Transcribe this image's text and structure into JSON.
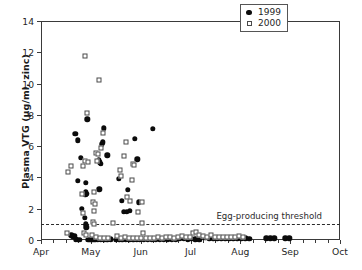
{
  "chart_data": {
    "type": "scatter",
    "title": "",
    "xlabel": "",
    "ylabel": "Plasma VTG (µg/ml, zinc)",
    "xtick_labels": [
      "Apr",
      "May",
      "Jun",
      "Jul",
      "Aug",
      "Sep",
      "Oct"
    ],
    "xtick_positions": [
      0,
      1,
      2,
      3,
      4,
      5,
      6
    ],
    "xlim": [
      0,
      6
    ],
    "ytick_labels": [
      "0",
      "2",
      "4",
      "6",
      "8",
      "10",
      "12",
      "14"
    ],
    "ytick_values": [
      0,
      2,
      4,
      6,
      8,
      10,
      12,
      14
    ],
    "ylim": [
      0,
      14
    ],
    "grid": false,
    "minor_xticks_per_month": 4,
    "legend": {
      "position": "top-right",
      "entries": [
        {
          "label": "1999",
          "marker": "filled-circle",
          "color": "#0b0b0b"
        },
        {
          "label": "2000",
          "marker": "open-square",
          "color": "#4a4a4a"
        }
      ]
    },
    "annotations": [
      {
        "text": "Egg-producing threshold",
        "y": 1.0,
        "x": 3.52,
        "type": "threshold-line-label",
        "line_style": "dashed"
      }
    ],
    "threshold": {
      "value": 1.0,
      "style": "dashed",
      "color": "#2b2b2b"
    },
    "series": [
      {
        "name": "1999",
        "marker": "filled-circle",
        "color": "#0b0b0b",
        "points": [
          [
            0.61,
            0.3
          ],
          [
            0.64,
            0.22
          ],
          [
            0.67,
            0.27
          ],
          [
            0.7,
            0.05
          ],
          [
            0.74,
            0.02
          ],
          [
            0.78,
            0.02
          ],
          [
            0.69,
            6.78
          ],
          [
            0.74,
            6.38
          ],
          [
            0.8,
            5.25
          ],
          [
            0.74,
            3.78
          ],
          [
            0.82,
            2.0
          ],
          [
            0.93,
            7.72
          ],
          [
            0.9,
            3.66
          ],
          [
            0.9,
            3.08
          ],
          [
            0.92,
            2.95
          ],
          [
            0.89,
            2.88
          ],
          [
            0.88,
            1.42
          ],
          [
            0.9,
            1.0
          ],
          [
            0.91,
            0.8
          ],
          [
            0.95,
            0.02
          ],
          [
            0.99,
            0.02
          ],
          [
            1.03,
            0.02
          ],
          [
            1.07,
            0.05
          ],
          [
            1.1,
            0.02
          ],
          [
            1.17,
            3.24
          ],
          [
            1.16,
            5.1
          ],
          [
            1.18,
            4.96
          ],
          [
            1.2,
            4.88
          ],
          [
            1.22,
            6.12
          ],
          [
            1.24,
            6.25
          ],
          [
            1.26,
            7.15
          ],
          [
            1.33,
            5.42
          ],
          [
            1.14,
            0.02
          ],
          [
            1.2,
            0.02
          ],
          [
            1.27,
            0.02
          ],
          [
            1.33,
            0.02
          ],
          [
            1.4,
            0.05
          ],
          [
            1.56,
            3.9
          ],
          [
            1.62,
            2.52
          ],
          [
            1.66,
            1.8
          ],
          [
            1.72,
            1.8
          ],
          [
            1.78,
            1.85
          ],
          [
            1.74,
            3.22
          ],
          [
            1.5,
            0.02
          ],
          [
            1.57,
            0.05
          ],
          [
            1.63,
            0.02
          ],
          [
            1.7,
            0.02
          ],
          [
            1.77,
            0.02
          ],
          [
            1.88,
            6.45
          ],
          [
            1.93,
            5.15
          ],
          [
            1.96,
            2.42
          ],
          [
            1.85,
            0.02
          ],
          [
            1.92,
            0.05
          ],
          [
            1.98,
            0.02
          ],
          [
            2.24,
            7.12
          ],
          [
            2.06,
            0.02
          ],
          [
            2.14,
            0.05
          ],
          [
            2.22,
            0.02
          ],
          [
            2.3,
            0.02
          ],
          [
            2.38,
            0.05
          ],
          [
            2.46,
            0.02
          ],
          [
            2.54,
            0.02
          ],
          [
            2.62,
            0.05
          ],
          [
            2.7,
            0.02
          ],
          [
            2.78,
            0.1
          ],
          [
            2.86,
            0.08
          ],
          [
            2.94,
            0.05
          ],
          [
            3.02,
            0.08
          ],
          [
            3.1,
            0.05
          ],
          [
            3.18,
            0.02
          ],
          [
            3.3,
            0.14
          ],
          [
            3.38,
            0.1
          ],
          [
            3.46,
            0.12
          ],
          [
            3.54,
            0.12
          ],
          [
            3.62,
            0.1
          ],
          [
            3.7,
            0.1
          ],
          [
            3.78,
            0.08
          ],
          [
            3.86,
            0.1
          ],
          [
            3.94,
            0.12
          ],
          [
            4.02,
            0.1
          ],
          [
            4.1,
            0.1
          ],
          [
            4.18,
            0.08
          ],
          [
            4.52,
            0.1
          ],
          [
            4.6,
            0.1
          ],
          [
            4.68,
            0.12
          ],
          [
            4.9,
            0.1
          ],
          [
            4.98,
            0.1
          ]
        ]
      },
      {
        "name": "2000",
        "marker": "open-square",
        "color": "#4a4a4a",
        "points": [
          [
            0.55,
            4.34
          ],
          [
            0.61,
            4.72
          ],
          [
            0.52,
            0.42
          ],
          [
            0.88,
            11.75
          ],
          [
            0.93,
            8.15
          ],
          [
            0.85,
            4.7
          ],
          [
            0.88,
            5.02
          ],
          [
            0.95,
            5.0
          ],
          [
            0.83,
            2.92
          ],
          [
            0.85,
            1.72
          ],
          [
            0.87,
            0.42
          ],
          [
            0.91,
            0.3
          ],
          [
            1.16,
            10.25
          ],
          [
            1.1,
            5.58
          ],
          [
            1.13,
            5.05
          ],
          [
            1.14,
            5.48
          ],
          [
            1.2,
            5.88
          ],
          [
            1.24,
            6.85
          ],
          [
            1.07,
            3.04
          ],
          [
            1.05,
            2.46
          ],
          [
            1.09,
            2.32
          ],
          [
            1.07,
            1.85
          ],
          [
            1.04,
            1.12
          ],
          [
            1.06,
            1.02
          ],
          [
            1.02,
            0.32
          ],
          [
            1.1,
            0.18
          ],
          [
            1.18,
            0.1
          ],
          [
            1.26,
            0.12
          ],
          [
            1.34,
            0.1
          ],
          [
            1.45,
            1.1
          ],
          [
            1.58,
            4.46
          ],
          [
            1.6,
            4.08
          ],
          [
            1.66,
            5.36
          ],
          [
            1.7,
            6.28
          ],
          [
            1.72,
            2.72
          ],
          [
            1.78,
            2.5
          ],
          [
            1.82,
            3.82
          ],
          [
            1.84,
            4.88
          ],
          [
            1.86,
            4.78
          ],
          [
            1.52,
            0.28
          ],
          [
            1.6,
            0.12
          ],
          [
            1.68,
            0.22
          ],
          [
            1.76,
            0.12
          ],
          [
            1.84,
            0.1
          ],
          [
            1.94,
            1.78
          ],
          [
            2.02,
            2.42
          ],
          [
            2.02,
            1.1
          ],
          [
            2.04,
            0.45
          ],
          [
            1.92,
            0.12
          ],
          [
            2.0,
            0.1
          ],
          [
            2.1,
            0.12
          ],
          [
            2.18,
            0.12
          ],
          [
            2.26,
            0.14
          ],
          [
            2.34,
            0.18
          ],
          [
            2.42,
            0.14
          ],
          [
            2.5,
            0.22
          ],
          [
            2.58,
            0.18
          ],
          [
            2.66,
            0.15
          ],
          [
            2.74,
            0.22
          ],
          [
            2.82,
            0.25
          ],
          [
            2.9,
            0.2
          ],
          [
            2.98,
            0.18
          ],
          [
            3.06,
            0.42
          ],
          [
            3.12,
            0.52
          ],
          [
            3.18,
            0.3
          ],
          [
            3.26,
            0.25
          ],
          [
            3.34,
            0.22
          ],
          [
            3.42,
            0.3
          ],
          [
            3.5,
            0.22
          ],
          [
            3.58,
            0.2
          ],
          [
            3.66,
            0.22
          ],
          [
            3.74,
            0.18
          ],
          [
            3.82,
            0.18
          ],
          [
            3.9,
            0.2
          ],
          [
            3.98,
            0.25
          ],
          [
            4.06,
            0.18
          ]
        ]
      }
    ]
  }
}
